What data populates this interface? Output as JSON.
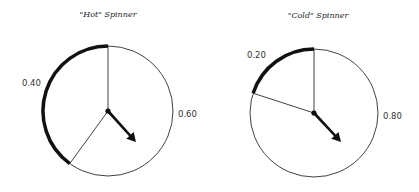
{
  "spinners": [
    {
      "title": "\"Hot\" Spinner",
      "center": [
        108,
        111
      ],
      "radius": 65,
      "bold_fraction": 0.4,
      "bold_label": "0.40",
      "light_label": "0.60",
      "bold_label_pos": [
        22,
        86
      ],
      "light_label_pos": [
        178,
        117
      ],
      "title_pos": [
        108,
        17
      ],
      "arrow_tip": [
        136,
        142
      ]
    },
    {
      "title": "\"Cold\" Spinner",
      "center": [
        314,
        113
      ],
      "radius": 64,
      "bold_fraction": 0.2,
      "bold_label": "0.20",
      "light_label": "0.80",
      "bold_label_pos": [
        247,
        58
      ],
      "light_label_pos": [
        383,
        119
      ],
      "title_pos": [
        318,
        18
      ],
      "arrow_tip": [
        341,
        142
      ]
    }
  ],
  "colors": {
    "stroke": "#111111",
    "background": "#ffffff"
  }
}
